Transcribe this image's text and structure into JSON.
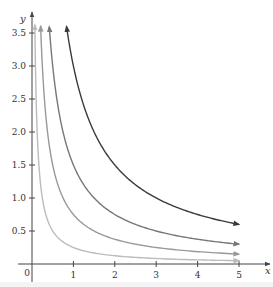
{
  "chart_data": {
    "type": "line",
    "title": "",
    "xlabel": "x",
    "ylabel": "y",
    "xlim": [
      0,
      5.5
    ],
    "ylim": [
      0,
      3.6
    ],
    "grid": false,
    "legend": null,
    "x_ticks": [
      1,
      2,
      3,
      4,
      5
    ],
    "x_tick_labels": [
      "1",
      "2",
      "3",
      "4",
      "5"
    ],
    "y_ticks": [
      0.5,
      1.0,
      1.5,
      2.0,
      2.5,
      3.0,
      3.5
    ],
    "y_tick_labels": [
      "0.5",
      "1.0",
      "1.5",
      "2.0",
      "2.5",
      "3.0",
      "3.5"
    ],
    "origin_label": "0",
    "series": [
      {
        "name": "y = 3/x",
        "k": 3,
        "color": "#3a3a3a",
        "x_range": [
          0.833,
          5
        ],
        "endpoints": {
          "top": [
            0.83,
            3.6
          ],
          "right": [
            5,
            0.6
          ]
        }
      },
      {
        "name": "y = 1.5/x",
        "k": 1.5,
        "color": "#777777",
        "x_range": [
          0.417,
          5
        ],
        "endpoints": {
          "top": [
            0.42,
            3.6
          ],
          "right": [
            5,
            0.3
          ]
        }
      },
      {
        "name": "y = 0.75/x",
        "k": 0.75,
        "color": "#999999",
        "x_range": [
          0.208,
          5
        ],
        "endpoints": {
          "top": [
            0.21,
            3.6
          ],
          "right": [
            5,
            0.15
          ]
        }
      },
      {
        "name": "y = 0.25/x",
        "k": 0.25,
        "color": "#bbbbbb",
        "x_range": [
          0.069,
          5
        ],
        "endpoints": {
          "top": [
            0.07,
            3.6
          ],
          "right": [
            5,
            0.05
          ]
        }
      }
    ],
    "annotations": [
      "Curves are arrows at both ends (hyperbolas y = k/x, x > 0)"
    ]
  },
  "layout": {
    "origin_px": [
      32,
      264
    ],
    "x_px_per_unit": 41.4,
    "y_px_per_unit": 66,
    "x_axis_end_px": 270,
    "y_axis_top_px": 12
  }
}
